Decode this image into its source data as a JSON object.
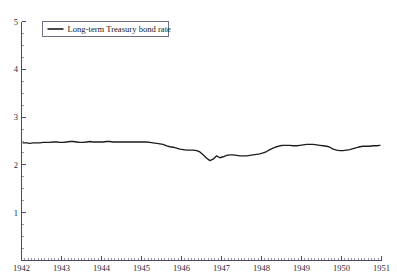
{
  "chart_data": {
    "type": "line",
    "title": "",
    "subtitle": "",
    "xlabel": "",
    "ylabel": "",
    "xlim": [
      1942.0,
      1951.0
    ],
    "ylim": [
      0,
      5
    ],
    "grid": false,
    "legend_position": "top-left",
    "y_ticks_major": [
      1,
      2,
      3,
      4,
      5
    ],
    "y_ticks_major_labels": [
      "1",
      "2",
      "3",
      "4",
      "5"
    ],
    "y_tick_minor_step": 0.25,
    "x_ticks_major": [
      1942,
      1943,
      1944,
      1945,
      1946,
      1947,
      1948,
      1949,
      1950,
      1951
    ],
    "x_ticks_major_labels": [
      "1942",
      "1943",
      "1944",
      "1945",
      "1946",
      "1947",
      "1948",
      "1949",
      "1950",
      "1951"
    ],
    "x_tick_minor_step": 0.08333,
    "series": [
      {
        "name": "Long-term Treasury bond rate",
        "color": "#1c1c1c",
        "x": [
          1942.04,
          1942.13,
          1942.21,
          1942.29,
          1942.38,
          1942.46,
          1942.54,
          1942.63,
          1942.71,
          1942.79,
          1942.88,
          1942.96,
          1943.04,
          1943.13,
          1943.21,
          1943.29,
          1943.38,
          1943.46,
          1943.54,
          1943.63,
          1943.71,
          1943.79,
          1943.88,
          1943.96,
          1944.04,
          1944.13,
          1944.21,
          1944.29,
          1944.38,
          1944.46,
          1944.54,
          1944.63,
          1944.71,
          1944.79,
          1944.88,
          1944.96,
          1945.04,
          1945.13,
          1945.21,
          1945.29,
          1945.38,
          1945.46,
          1945.54,
          1945.63,
          1945.71,
          1945.79,
          1945.88,
          1945.96,
          1946.04,
          1946.13,
          1946.21,
          1946.29,
          1946.38,
          1946.46,
          1946.54,
          1946.63,
          1946.71,
          1946.79,
          1946.88,
          1946.96,
          1947.04,
          1947.13,
          1947.21,
          1947.29,
          1947.38,
          1947.46,
          1947.54,
          1947.63,
          1947.71,
          1947.79,
          1947.88,
          1947.96,
          1948.04,
          1948.13,
          1948.21,
          1948.29,
          1948.38,
          1948.46,
          1948.54,
          1948.63,
          1948.71,
          1948.79,
          1948.88,
          1948.96,
          1949.04,
          1949.13,
          1949.21,
          1949.29,
          1949.38,
          1949.46,
          1949.54,
          1949.63,
          1949.71,
          1949.79,
          1949.88,
          1949.96,
          1950.04,
          1950.13,
          1950.21,
          1950.29,
          1950.38,
          1950.46,
          1950.54,
          1950.63,
          1950.71,
          1950.79,
          1950.88,
          1950.96
        ],
        "values": [
          2.46,
          2.46,
          2.45,
          2.46,
          2.46,
          2.46,
          2.47,
          2.47,
          2.47,
          2.48,
          2.48,
          2.47,
          2.47,
          2.48,
          2.49,
          2.49,
          2.48,
          2.47,
          2.47,
          2.48,
          2.49,
          2.48,
          2.48,
          2.48,
          2.48,
          2.49,
          2.49,
          2.48,
          2.48,
          2.48,
          2.48,
          2.48,
          2.48,
          2.48,
          2.48,
          2.48,
          2.48,
          2.48,
          2.47,
          2.46,
          2.45,
          2.44,
          2.43,
          2.4,
          2.38,
          2.37,
          2.35,
          2.33,
          2.32,
          2.31,
          2.31,
          2.31,
          2.3,
          2.27,
          2.21,
          2.14,
          2.09,
          2.12,
          2.19,
          2.15,
          2.17,
          2.2,
          2.21,
          2.21,
          2.2,
          2.19,
          2.19,
          2.19,
          2.2,
          2.21,
          2.22,
          2.23,
          2.25,
          2.28,
          2.32,
          2.35,
          2.38,
          2.4,
          2.41,
          2.41,
          2.41,
          2.4,
          2.4,
          2.41,
          2.42,
          2.43,
          2.43,
          2.43,
          2.42,
          2.41,
          2.4,
          2.39,
          2.37,
          2.33,
          2.31,
          2.3,
          2.3,
          2.31,
          2.32,
          2.34,
          2.36,
          2.38,
          2.39,
          2.39,
          2.39,
          2.4,
          2.4,
          2.41
        ]
      }
    ]
  },
  "legend": {
    "entries": [
      {
        "label": "Long-term Treasury bond rate"
      }
    ]
  }
}
